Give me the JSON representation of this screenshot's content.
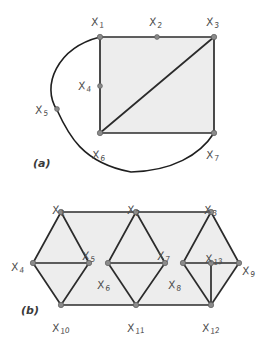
{
  "figure": {
    "background_color": "#ffffff",
    "fill_color": "#ededed",
    "edge_color": "#2b2b2b",
    "node_color": "#8a8a8a",
    "label_color": "#4a4a4a",
    "panels": [
      {
        "id": "a",
        "caption": "(a)",
        "caption_pos": {
          "x": 33,
          "y": 157
        },
        "fill_polygon": "100,37 214,37 214,133 100,133",
        "edges": [
          {
            "name": "edge-x1-x3-top",
            "d": "M 100 37 L 214 37"
          },
          {
            "name": "edge-x3-x7-right",
            "d": "M 214 37 L 214 133"
          },
          {
            "name": "edge-x6-x7-bottom",
            "d": "M 100 133 L 214 133"
          },
          {
            "name": "edge-x1-x6-left",
            "d": "M 100 37 L 100 133"
          },
          {
            "name": "edge-x6-x3-diagonal",
            "d": "M 100 133 L 214 37"
          }
        ],
        "curves": [
          {
            "name": "curve-x1-x5-x6-x7",
            "d": "M 100 37 C 57 48 41 86 57 110 C 68 134 82 163 131 172 C 172 171 200 155 214 133"
          }
        ],
        "nodes": [
          {
            "name": "node-x1",
            "x": 100,
            "y": 37,
            "r": 2.7
          },
          {
            "name": "node-x2",
            "x": 157,
            "y": 37,
            "r": 2.4
          },
          {
            "name": "node-x3",
            "x": 214,
            "y": 37,
            "r": 2.7
          },
          {
            "name": "node-x4",
            "x": 100,
            "y": 86,
            "r": 2.4
          },
          {
            "name": "node-x5",
            "x": 57,
            "y": 109,
            "r": 2.4
          },
          {
            "name": "node-x6",
            "x": 100,
            "y": 133,
            "r": 2.7
          },
          {
            "name": "node-x7",
            "x": 214,
            "y": 133,
            "r": 2.7
          }
        ],
        "labels": [
          {
            "name": "label-x1",
            "text": "X",
            "sub": "1",
            "x": 92,
            "y": 17
          },
          {
            "name": "label-x2",
            "text": "X",
            "sub": "2",
            "x": 150,
            "y": 17
          },
          {
            "name": "label-x3",
            "text": "X",
            "sub": "3",
            "x": 207,
            "y": 17
          },
          {
            "name": "label-x4",
            "text": "X",
            "sub": "4",
            "x": 79,
            "y": 81
          },
          {
            "name": "label-x5",
            "text": "X",
            "sub": "5",
            "x": 36,
            "y": 105
          },
          {
            "name": "label-x6",
            "text": "X",
            "sub": "6",
            "x": 93,
            "y": 150
          },
          {
            "name": "label-x7",
            "text": "X",
            "sub": "7",
            "x": 207,
            "y": 150
          }
        ]
      },
      {
        "id": "b",
        "caption": "(b)",
        "caption_pos": {
          "x": 21,
          "y": 304
        },
        "fill_polygon": "61,212 136,212 211,212 239,263 211,305 136,305 61,305 33,263",
        "edges": [
          {
            "name": "edge-x1-x2-top",
            "d": "M 61 212 L 136 212"
          },
          {
            "name": "edge-x2-x3-top",
            "d": "M 136 212 L 211 212"
          },
          {
            "name": "edge-x10-x11-bottom",
            "d": "M 61 305 L 136 305"
          },
          {
            "name": "edge-x11-x12-bottom",
            "d": "M 136 305 L 211 305"
          },
          {
            "name": "edge-x1-x4",
            "d": "M 61 212 L 33 263"
          },
          {
            "name": "edge-x4-x10",
            "d": "M 33 263 L 61 305"
          },
          {
            "name": "edge-x1-x5",
            "d": "M 61 212 L 89 263"
          },
          {
            "name": "edge-x5-x10",
            "d": "M 89 263 L 61 305"
          },
          {
            "name": "edge-x4-x5",
            "d": "M 33 263 L 89 263"
          },
          {
            "name": "edge-x2-x6",
            "d": "M 136 212 L 108 263"
          },
          {
            "name": "edge-x6-x11",
            "d": "M 108 263 L 136 305"
          },
          {
            "name": "edge-x2-x7",
            "d": "M 136 212 L 165 263"
          },
          {
            "name": "edge-x7-x11",
            "d": "M 165 263 L 136 305"
          },
          {
            "name": "edge-x6-x7",
            "d": "M 108 263 L 165 263"
          },
          {
            "name": "edge-x3-x8",
            "d": "M 211 212 L 183 263"
          },
          {
            "name": "edge-x8-x12",
            "d": "M 183 263 L 211 305"
          },
          {
            "name": "edge-x3-x9",
            "d": "M 211 212 L 239 263"
          },
          {
            "name": "edge-x9-x12",
            "d": "M 239 263 L 211 305"
          },
          {
            "name": "edge-x8-x9",
            "d": "M 183 263 L 239 263"
          },
          {
            "name": "edge-x13-x12-vertical",
            "d": "M 211 263 L 211 305"
          }
        ],
        "nodes": [
          {
            "name": "node-x1",
            "x": 61,
            "y": 212,
            "r": 2.7
          },
          {
            "name": "node-x2",
            "x": 136,
            "y": 212,
            "r": 2.7
          },
          {
            "name": "node-x3",
            "x": 211,
            "y": 212,
            "r": 2.7
          },
          {
            "name": "node-x4",
            "x": 33,
            "y": 263,
            "r": 2.7
          },
          {
            "name": "node-x5",
            "x": 89,
            "y": 263,
            "r": 2.7
          },
          {
            "name": "node-x6",
            "x": 108,
            "y": 263,
            "r": 2.7
          },
          {
            "name": "node-x7",
            "x": 165,
            "y": 263,
            "r": 2.7
          },
          {
            "name": "node-x8",
            "x": 183,
            "y": 263,
            "r": 2.7
          },
          {
            "name": "node-x9",
            "x": 239,
            "y": 263,
            "r": 2.7
          },
          {
            "name": "node-x10",
            "x": 61,
            "y": 305,
            "r": 2.7
          },
          {
            "name": "node-x11",
            "x": 136,
            "y": 305,
            "r": 2.7
          },
          {
            "name": "node-x12",
            "x": 211,
            "y": 305,
            "r": 2.7
          },
          {
            "name": "node-x13",
            "x": 211,
            "y": 263,
            "r": 2.7
          }
        ],
        "labels": [
          {
            "name": "label-x1",
            "text": "X",
            "sub": "1",
            "x": 53,
            "y": 205
          },
          {
            "name": "label-x2",
            "text": "X",
            "sub": "2",
            "x": 128,
            "y": 205
          },
          {
            "name": "label-x3",
            "text": "X",
            "sub": "3",
            "x": 205,
            "y": 205
          },
          {
            "name": "label-x4",
            "text": "X",
            "sub": "4",
            "x": 12,
            "y": 262
          },
          {
            "name": "label-x5",
            "text": "X",
            "sub": "5",
            "x": 83,
            "y": 251
          },
          {
            "name": "label-x6",
            "text": "X",
            "sub": "6",
            "x": 98,
            "y": 280
          },
          {
            "name": "label-x7",
            "text": "X",
            "sub": "7",
            "x": 158,
            "y": 251
          },
          {
            "name": "label-x8",
            "text": "X",
            "sub": "8",
            "x": 169,
            "y": 280
          },
          {
            "name": "label-x9",
            "text": "X",
            "sub": "9",
            "x": 243,
            "y": 266
          },
          {
            "name": "label-x10",
            "text": "X",
            "sub": "10",
            "x": 53,
            "y": 323
          },
          {
            "name": "label-x11",
            "text": "X",
            "sub": "11",
            "x": 128,
            "y": 323
          },
          {
            "name": "label-x12",
            "text": "X",
            "sub": "12",
            "x": 203,
            "y": 323
          },
          {
            "name": "label-x13",
            "text": "X",
            "sub": "13",
            "x": 206,
            "y": 254
          }
        ]
      }
    ]
  }
}
